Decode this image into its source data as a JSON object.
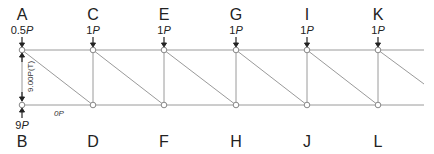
{
  "diagram": {
    "type": "truss",
    "top_nodes": [
      {
        "id": "A",
        "x": 22,
        "load_num": "0.5",
        "load_unit": "P"
      },
      {
        "id": "C",
        "x": 93,
        "load_num": "1",
        "load_unit": "P"
      },
      {
        "id": "E",
        "x": 164,
        "load_num": "1",
        "load_unit": "P"
      },
      {
        "id": "G",
        "x": 236,
        "load_num": "1",
        "load_unit": "P"
      },
      {
        "id": "I",
        "x": 307,
        "load_num": "1",
        "load_unit": "P"
      },
      {
        "id": "K",
        "x": 378,
        "load_num": "1",
        "load_unit": "P"
      }
    ],
    "bottom_nodes": [
      {
        "id": "B",
        "x": 22,
        "reaction_num": "9",
        "reaction_unit": "P"
      },
      {
        "id": "D",
        "x": 93
      },
      {
        "id": "F",
        "x": 164
      },
      {
        "id": "H",
        "x": 236
      },
      {
        "id": "J",
        "x": 307
      },
      {
        "id": "L",
        "x": 378
      }
    ],
    "member_labels": {
      "AB": "9.00P(T)",
      "BD": "0P"
    },
    "colors": {
      "member": "#999999",
      "arrow": "#222222",
      "text": "#222222"
    }
  }
}
